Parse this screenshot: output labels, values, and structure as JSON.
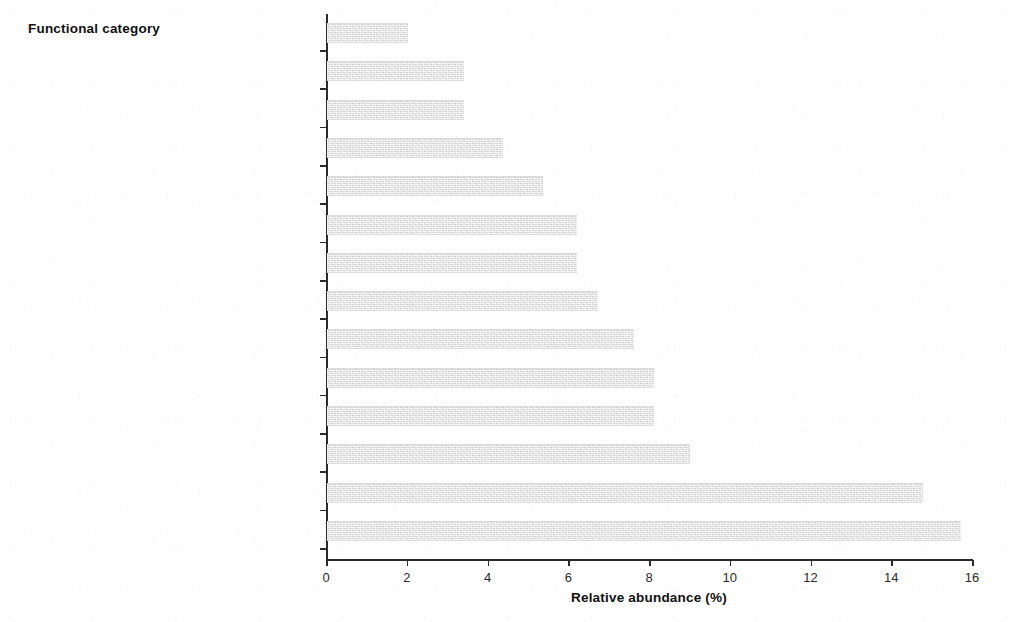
{
  "figure": {
    "y_axis_title": "Functional category",
    "x_axis_title": "Relative abundance (%)",
    "bar_color": "#e4e4e4",
    "axis_color": "#2b2b2b"
  },
  "chart_data": {
    "type": "bar",
    "orientation": "horizontal",
    "title": "",
    "xlabel": "Relative abundance (%)",
    "ylabel": "Functional category",
    "xlim": [
      0,
      16
    ],
    "xticks": [
      0,
      2,
      4,
      6,
      8,
      10,
      12,
      14,
      16
    ],
    "xtick_labels": [
      "0",
      "2",
      "4",
      "6",
      "8",
      "10",
      "12",
      "14",
      "16"
    ],
    "grid": false,
    "legend": false,
    "categories": [
      "Cell fate",
      "Interaction with the environment",
      "Cell rescue",
      "Cell type differentiation",
      "Energy",
      "Cellular transport",
      "Cell cycle and DNA processing",
      "Unclassified proteins",
      "Transcription",
      "Protein fate",
      "Metabolism",
      "Protein with binding or cofactor requirement",
      "Biogenesis of cellular components",
      "Protein synthesis"
    ],
    "values": [
      2.0,
      3.4,
      3.4,
      4.35,
      5.35,
      6.2,
      6.2,
      6.7,
      7.6,
      8.1,
      8.1,
      9.0,
      14.75,
      15.7
    ]
  }
}
